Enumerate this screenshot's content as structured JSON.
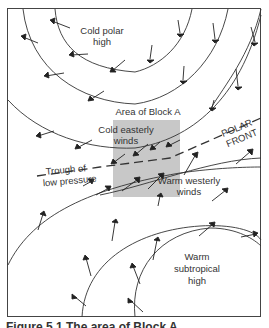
{
  "figure": {
    "labels": {
      "cold_polar_high": [
        "Cold polar",
        "high"
      ],
      "area_of_block": "Area of Block A",
      "cold_easterly": [
        "Cold easterly",
        "winds"
      ],
      "polar_front": [
        "POLAR",
        "FRONT"
      ],
      "trough": [
        "Trough of",
        "low pressure"
      ],
      "warm_westerly": [
        "Warm westerly",
        "winds"
      ],
      "warm_subtropical_high": [
        "Warm",
        "subtropical",
        "high"
      ]
    },
    "caption": "Figure 5.1  The area of Block A",
    "colors": {
      "line": "#333333",
      "block_fill": "#c8c8c8",
      "border": "#444444",
      "background": "#ffffff"
    }
  }
}
